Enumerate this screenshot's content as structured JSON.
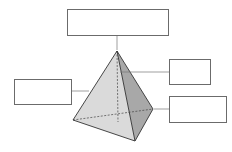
{
  "diagram": {
    "type": "labeled tetrahedron",
    "labels": {
      "top": "",
      "left": "",
      "right_upper": "",
      "right_lower": ""
    },
    "colors": {
      "face_front": "#dcdcdc",
      "face_right": "#a9a9a9",
      "edge": "#333333",
      "leader": "#777777"
    }
  }
}
